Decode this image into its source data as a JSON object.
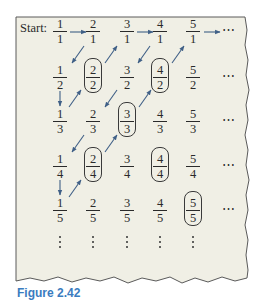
{
  "figure": {
    "start_label": "Start:",
    "caption": "Figure 2.42",
    "colors": {
      "background": "#f0efe5",
      "border": "#5a5a5a",
      "arrow": "#3f5f86",
      "text": "#2a2a2a",
      "caption": "#3a7cc0"
    }
  },
  "grid": {
    "rows": [
      [
        {
          "num": "1",
          "den": "1",
          "circled": false
        },
        {
          "num": "2",
          "den": "1",
          "circled": false
        },
        {
          "num": "3",
          "den": "1",
          "circled": false
        },
        {
          "num": "4",
          "den": "1",
          "circled": false
        },
        {
          "num": "5",
          "den": "1",
          "circled": false
        }
      ],
      [
        {
          "num": "1",
          "den": "2",
          "circled": false
        },
        {
          "num": "2",
          "den": "2",
          "circled": true
        },
        {
          "num": "3",
          "den": "2",
          "circled": false
        },
        {
          "num": "4",
          "den": "2",
          "circled": true
        },
        {
          "num": "5",
          "den": "2",
          "circled": false
        }
      ],
      [
        {
          "num": "1",
          "den": "3",
          "circled": false
        },
        {
          "num": "2",
          "den": "3",
          "circled": false
        },
        {
          "num": "3",
          "den": "3",
          "circled": true
        },
        {
          "num": "4",
          "den": "3",
          "circled": false
        },
        {
          "num": "5",
          "den": "3",
          "circled": false
        }
      ],
      [
        {
          "num": "1",
          "den": "4",
          "circled": false
        },
        {
          "num": "2",
          "den": "4",
          "circled": true
        },
        {
          "num": "3",
          "den": "4",
          "circled": false
        },
        {
          "num": "4",
          "den": "4",
          "circled": true
        },
        {
          "num": "5",
          "den": "4",
          "circled": false
        }
      ],
      [
        {
          "num": "1",
          "den": "5",
          "circled": false
        },
        {
          "num": "2",
          "den": "5",
          "circled": false
        },
        {
          "num": "3",
          "den": "5",
          "circled": false
        },
        {
          "num": "4",
          "den": "5",
          "circled": false
        },
        {
          "num": "5",
          "den": "5",
          "circled": true
        }
      ]
    ],
    "row_ellipsis": "⋯",
    "column_ellipsis": "⋮",
    "path": [
      "1/1",
      "2/1",
      "1/2",
      "1/3",
      "2/2",
      "3/1",
      "4/1",
      "3/2",
      "2/3",
      "1/4",
      "1/5",
      "2/4",
      "3/3",
      "4/2",
      "5/1",
      "..."
    ]
  }
}
